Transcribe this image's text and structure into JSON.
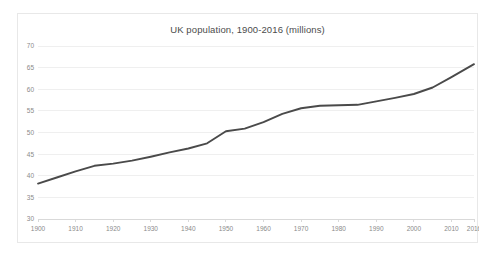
{
  "chart_data": {
    "type": "line",
    "title": "UK population, 1900-2016 (millions)",
    "xlabel": "",
    "ylabel": "",
    "xlim": [
      1900,
      2016
    ],
    "ylim": [
      30,
      70
    ],
    "ytick_step": 5,
    "grid": true,
    "legend": false,
    "line_color": "#4a4a4a",
    "grid_color": "#efefef",
    "axis_color": "#d9d9d9",
    "tick_label_color": "#8a8a8a",
    "title_color": "#4c4c4c",
    "yticks": [
      30,
      35,
      40,
      45,
      50,
      55,
      60,
      65,
      70
    ],
    "xticks": [
      1900,
      1910,
      1920,
      1930,
      1940,
      1950,
      1960,
      1970,
      1980,
      1990,
      2000,
      2010,
      2016
    ],
    "x": [
      1900,
      1905,
      1910,
      1915,
      1920,
      1925,
      1930,
      1935,
      1940,
      1945,
      1950,
      1955,
      1960,
      1965,
      1970,
      1975,
      1980,
      1985,
      1990,
      1995,
      2000,
      2005,
      2010,
      2016
    ],
    "values": [
      38.2,
      39.6,
      41.0,
      42.3,
      42.8,
      43.5,
      44.4,
      45.4,
      46.3,
      47.5,
      50.3,
      50.9,
      52.4,
      54.3,
      55.6,
      56.2,
      56.3,
      56.4,
      57.2,
      58.0,
      58.9,
      60.4,
      62.8,
      65.8
    ],
    "data_points": [
      {
        "year": 1900,
        "population": 38.2
      },
      {
        "year": 1905,
        "population": 39.6
      },
      {
        "year": 1910,
        "population": 41.0
      },
      {
        "year": 1915,
        "population": 42.3
      },
      {
        "year": 1920,
        "population": 42.8
      },
      {
        "year": 1925,
        "population": 43.5
      },
      {
        "year": 1930,
        "population": 44.4
      },
      {
        "year": 1935,
        "population": 45.4
      },
      {
        "year": 1940,
        "population": 46.3
      },
      {
        "year": 1945,
        "population": 47.5
      },
      {
        "year": 1950,
        "population": 50.3
      },
      {
        "year": 1955,
        "population": 50.9
      },
      {
        "year": 1960,
        "population": 52.4
      },
      {
        "year": 1965,
        "population": 54.3
      },
      {
        "year": 1970,
        "population": 55.6
      },
      {
        "year": 1975,
        "population": 56.2
      },
      {
        "year": 1980,
        "population": 56.3
      },
      {
        "year": 1985,
        "population": 56.4
      },
      {
        "year": 1990,
        "population": 57.2
      },
      {
        "year": 1995,
        "population": 58.0
      },
      {
        "year": 2000,
        "population": 58.9
      },
      {
        "year": 2005,
        "population": 60.4
      },
      {
        "year": 2010,
        "population": 62.8
      },
      {
        "year": 2016,
        "population": 65.8
      }
    ]
  }
}
